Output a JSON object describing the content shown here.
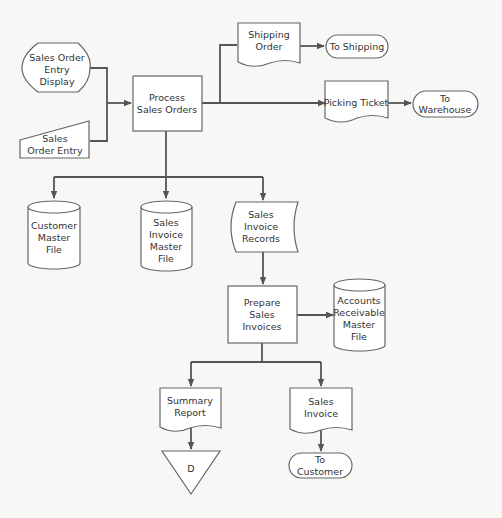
{
  "diagram": {
    "type": "system-flowchart",
    "nodes": {
      "entry_display": {
        "shape": "display",
        "lines": [
          "Sales Order",
          "Entry",
          "Display"
        ]
      },
      "entry": {
        "shape": "manual-input",
        "lines": [
          "Sales",
          "Order Entry"
        ]
      },
      "process": {
        "shape": "process",
        "lines": [
          "Process",
          "Sales Orders"
        ]
      },
      "shipping_order": {
        "shape": "document",
        "lines": [
          "Shipping",
          "Order"
        ]
      },
      "to_shipping": {
        "shape": "terminal",
        "lines": [
          "To Shipping"
        ]
      },
      "picking_ticket": {
        "shape": "document",
        "lines": [
          "Picking Ticket"
        ]
      },
      "to_warehouse": {
        "shape": "terminal",
        "lines": [
          "To",
          "Warehouse"
        ]
      },
      "customer_master": {
        "shape": "disk",
        "lines": [
          "Customer",
          "Master",
          "File"
        ]
      },
      "invoice_master": {
        "shape": "disk",
        "lines": [
          "Sales",
          "Invoice",
          "Master",
          "File"
        ]
      },
      "invoice_records": {
        "shape": "stored-data",
        "lines": [
          "Sales",
          "Invoice",
          "Records"
        ]
      },
      "prepare": {
        "shape": "process",
        "lines": [
          "Prepare",
          "Sales",
          "Invoices"
        ]
      },
      "ar_master": {
        "shape": "disk",
        "lines": [
          "Accounts",
          "Receivable",
          "Master",
          "File"
        ]
      },
      "summary_report": {
        "shape": "document",
        "lines": [
          "Summary",
          "Report"
        ]
      },
      "sales_invoice": {
        "shape": "document",
        "lines": [
          "Sales",
          "Invoice"
        ]
      },
      "offline_storage": {
        "shape": "offline-storage",
        "lines": [
          "D"
        ]
      },
      "to_customer": {
        "shape": "terminal",
        "lines": [
          "To",
          "Customer"
        ]
      }
    },
    "edges": [
      {
        "from": "entry_display",
        "to": "process"
      },
      {
        "from": "entry",
        "to": "process"
      },
      {
        "from": "process",
        "to": "shipping_order"
      },
      {
        "from": "shipping_order",
        "to": "to_shipping"
      },
      {
        "from": "process",
        "to": "picking_ticket"
      },
      {
        "from": "picking_ticket",
        "to": "to_warehouse"
      },
      {
        "from": "process",
        "to": "customer_master"
      },
      {
        "from": "process",
        "to": "invoice_master"
      },
      {
        "from": "process",
        "to": "invoice_records"
      },
      {
        "from": "invoice_records",
        "to": "prepare"
      },
      {
        "from": "prepare",
        "to": "ar_master"
      },
      {
        "from": "prepare",
        "to": "summary_report"
      },
      {
        "from": "prepare",
        "to": "sales_invoice"
      },
      {
        "from": "summary_report",
        "to": "offline_storage"
      },
      {
        "from": "sales_invoice",
        "to": "to_customer"
      }
    ]
  }
}
